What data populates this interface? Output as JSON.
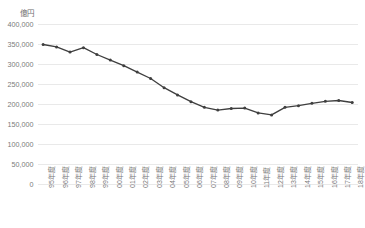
{
  "chart_data": {
    "type": "line",
    "title": "",
    "subtitle": "",
    "unit_label": "億円",
    "xlabel": "",
    "ylabel": "",
    "ylim": [
      0,
      400000
    ],
    "ytick_step": 50000,
    "ytick_labels": [
      "400,000",
      "350,000",
      "300,000",
      "250,000",
      "200,000",
      "150,000",
      "100,000",
      "50,000",
      "0"
    ],
    "ytick_values": [
      400000,
      350000,
      300000,
      250000,
      200000,
      150000,
      100000,
      50000,
      0
    ],
    "grid": true,
    "grid_axis": "y",
    "legend": false,
    "legend_position": "none",
    "marker": "circle",
    "line_color": "#3f3f3f",
    "grid_color": "#e9e9e9",
    "tick_text_color": "#7a7a7a",
    "categories": [
      "95年度",
      "96年度",
      "97年度",
      "98年度",
      "99年度",
      "00年度",
      "01年度",
      "02年度",
      "03年度",
      "04年度",
      "05年度",
      "06年度",
      "07年度",
      "08年度",
      "09年度",
      "10年度",
      "11年度",
      "12年度",
      "13年度",
      "14年度",
      "15年度",
      "16年度",
      "17年度",
      "18年度"
    ],
    "values": [
      350000,
      344000,
      331000,
      342000,
      325000,
      311000,
      297000,
      281000,
      265000,
      242000,
      224000,
      207000,
      193000,
      186000,
      190000,
      191000,
      179000,
      174000,
      193000,
      197000,
      203000,
      208000,
      210000,
      205000
    ]
  }
}
